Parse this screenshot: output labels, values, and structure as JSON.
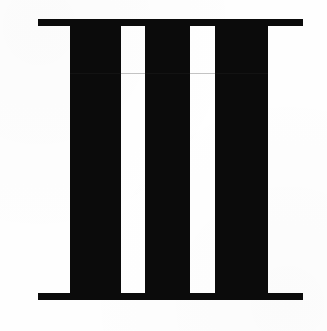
{
  "figure": {
    "canvas": {
      "width": 327,
      "height": 331,
      "background_color": "#fefefe"
    },
    "ink_color": "#0b0b0b",
    "paper_color": "#ffffff",
    "seam_color": "#2a2a2a",
    "elements": {
      "top_rule": {
        "name": "top-horizontal-rule",
        "x": 38,
        "y": 19,
        "width": 265,
        "height": 7
      },
      "bottom_rule": {
        "name": "bottom-horizontal-rule",
        "x": 38,
        "y": 293,
        "width": 265,
        "height": 7
      },
      "pillars": [
        {
          "name": "pillar-left",
          "x": 70,
          "y": 19,
          "width": 51,
          "height": 281
        },
        {
          "name": "pillar-center",
          "x": 145,
          "y": 19,
          "width": 45,
          "height": 281
        },
        {
          "name": "pillar-right",
          "x": 215,
          "y": 19,
          "width": 53,
          "height": 281
        }
      ],
      "gaps": [
        {
          "name": "gap-left",
          "x": 121,
          "y": 26,
          "width": 24,
          "height": 267
        },
        {
          "name": "gap-right",
          "x": 190,
          "y": 26,
          "width": 25,
          "height": 267
        }
      ],
      "seam": {
        "name": "scan-seam-artifact",
        "x": 70,
        "y": 73,
        "width": 198,
        "height": 1,
        "opacity": 0.28
      }
    },
    "counts": {
      "pillars": 3,
      "rules": 2,
      "gaps": 2
    }
  }
}
